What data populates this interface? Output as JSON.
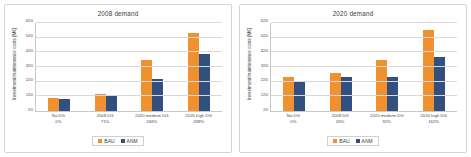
{
  "figure": {
    "panel_count": 2,
    "colors": {
      "bau": "#f0912d",
      "anm": "#31507f",
      "gridline": "#d9d9d9",
      "axis": "#c8c8c8",
      "border": "#d4d4d4",
      "background": "#ffffff"
    }
  },
  "legend": {
    "bau_label": "BAU",
    "anm_label": "ANM"
  },
  "chart_data": [
    {
      "type": "bar",
      "title": "2008 demand",
      "xlabel": "",
      "ylabel": "Investment/maintenance costs [M€]",
      "ylim": [
        20,
        620
      ],
      "yticks": [
        20,
        120,
        220,
        320,
        420,
        520,
        620
      ],
      "ytick_labels": [
        "20",
        "120",
        "220",
        "320",
        "420",
        "520",
        "620"
      ],
      "grid": true,
      "legend_position": "bottom-center",
      "categories": [
        "No DG",
        "2008 DG",
        "2020 medium DG",
        "2020 high DG"
      ],
      "category_sublabels": [
        "0%",
        "71%",
        "246%",
        "438%"
      ],
      "series": [
        {
          "name": "BAU",
          "values": [
            108,
            138,
            365,
            555
          ]
        },
        {
          "name": "ANM",
          "values": [
            103,
            125,
            240,
            408
          ]
        }
      ]
    },
    {
      "type": "bar",
      "title": "2020 demand",
      "xlabel": "",
      "ylabel": "Investment/maintenance costs [M€]",
      "ylim": [
        20,
        620
      ],
      "yticks": [
        20,
        120,
        220,
        320,
        420,
        520,
        620
      ],
      "ytick_labels": [
        "20",
        "120",
        "220",
        "320",
        "420",
        "520",
        "620"
      ],
      "grid": true,
      "legend_position": "bottom-center",
      "categories": [
        "No DG",
        "2008 DG",
        "2020 medium DG",
        "2020 high DG"
      ],
      "category_sublabels": [
        "0%",
        "26%",
        "92%",
        "162%"
      ],
      "series": [
        {
          "name": "BAU",
          "values": [
            255,
            280,
            370,
            570
          ]
        },
        {
          "name": "ANM",
          "values": [
            228,
            253,
            250,
            388
          ]
        }
      ]
    }
  ]
}
